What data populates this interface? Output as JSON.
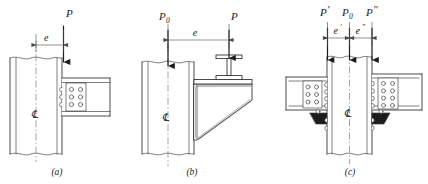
{
  "figure": {
    "background_color": "#ffffff",
    "line_color": "#2b2b2b",
    "width": 428,
    "height": 184
  },
  "panels": [
    {
      "id": "a",
      "caption": "(a)",
      "description": "Single beam framed to one column flange with bolted web connection, eccentric load P at distance e from column centerline",
      "centerline_label": "℄",
      "loads": [
        {
          "name": "load-P",
          "label": "P",
          "sub": "",
          "prime": ""
        }
      ],
      "dimensions": [
        {
          "name": "dimension-e",
          "label": "e"
        }
      ],
      "bolt_groups": [
        {
          "name": "web-plate-bolts",
          "columns": 2,
          "rows": 3
        },
        {
          "name": "flange-bolts-section",
          "columns": 1,
          "rows": 3
        }
      ]
    },
    {
      "id": "b",
      "caption": "(b)",
      "description": "Beam supported on a welded triangular seat bracket attached to column flange; axial column load P0 and beam reaction P at eccentricity e",
      "centerline_label": "℄",
      "loads": [
        {
          "name": "load-P0",
          "label": "P",
          "sub": "0",
          "prime": ""
        },
        {
          "name": "load-P",
          "label": "P",
          "sub": "",
          "prime": ""
        }
      ],
      "dimensions": [
        {
          "name": "dimension-e",
          "label": "e"
        }
      ],
      "bracket": {
        "name": "triangular-seat-bracket",
        "weld": "fillet-weld-hatching"
      },
      "beam_section": {
        "name": "i-beam-section"
      }
    },
    {
      "id": "c",
      "caption": "(c)",
      "description": "Beams framed to both column flanges with bolted connections and seat angles; column load P0 with beam reactions P' and P'' at eccentricities e' and e''",
      "centerline_label": "℄",
      "loads": [
        {
          "name": "load-P-prime",
          "label": "P",
          "sub": "",
          "prime": "′"
        },
        {
          "name": "load-P0",
          "label": "P",
          "sub": "0",
          "prime": ""
        },
        {
          "name": "load-P-double-prime",
          "label": "P",
          "sub": "",
          "prime": "″"
        }
      ],
      "dimensions": [
        {
          "name": "dimension-e-prime",
          "label": "e",
          "prime": "′"
        },
        {
          "name": "dimension-e-double-prime",
          "label": "e",
          "prime": "″"
        }
      ],
      "bolt_groups": [
        {
          "name": "left-web-plate-bolts",
          "columns": 2,
          "rows": 3
        },
        {
          "name": "left-flange-bolts-section",
          "columns": 1,
          "rows": 4
        },
        {
          "name": "right-web-plate-bolts",
          "columns": 2,
          "rows": 4
        },
        {
          "name": "right-flange-bolts-section",
          "columns": 1,
          "rows": 4
        }
      ],
      "seat_angles": [
        {
          "name": "left-seat-angle"
        },
        {
          "name": "right-seat-angle"
        }
      ]
    }
  ]
}
